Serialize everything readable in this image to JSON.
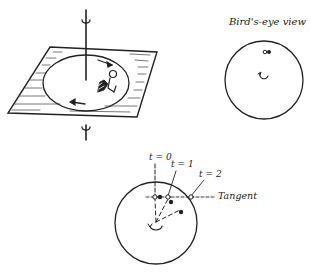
{
  "figure": {
    "panels": [
      {
        "id": "perspective",
        "description": "Rotating platform with vertical axis and rotation arrows, seated person on platform"
      },
      {
        "id": "birds_eye",
        "title": "Bird's-eye view"
      },
      {
        "id": "tangent",
        "labels": [
          "t = 0",
          "t = 1",
          "t = 2",
          "Tangent"
        ]
      }
    ],
    "birds_eye": {
      "title": "Bird's-eye view"
    },
    "tangent_view": {
      "t0": "t = 0",
      "t1": "t = 1",
      "t2": "t = 2",
      "tangent": "Tangent"
    },
    "colors": {
      "ink": "#222222",
      "background": "#ffffff"
    }
  }
}
